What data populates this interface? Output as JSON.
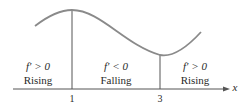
{
  "diagram": {
    "curve_label": "f",
    "axis_label": "x",
    "ticks": [
      {
        "label": "1"
      },
      {
        "label": "3"
      }
    ],
    "regions": [
      {
        "condition": "f′ > 0",
        "behavior": "Rising"
      },
      {
        "condition": "f′ < 0",
        "behavior": "Falling"
      },
      {
        "condition": "f′ > 0",
        "behavior": "Rising"
      }
    ],
    "colors": {
      "curve": "#8a8a8a",
      "lines": "#555555",
      "text": "#2a2a2a"
    }
  }
}
